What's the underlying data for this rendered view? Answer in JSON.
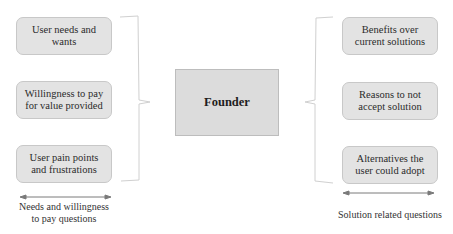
{
  "diagram": {
    "center": {
      "label": "Founder"
    },
    "left_group": {
      "items": [
        {
          "label": "User needs and wants"
        },
        {
          "label": "Willingness to pay for value provided"
        },
        {
          "label": "User pain points and frustrations"
        }
      ],
      "caption": "Needs and willingness to pay questions"
    },
    "right_group": {
      "items": [
        {
          "label": "Benefits over current solutions"
        },
        {
          "label": "Reasons to not accept solution"
        },
        {
          "label": "Alternatives the user could adopt"
        }
      ],
      "caption": "Solution related questions"
    },
    "colors": {
      "box_fill": "#e3e3e3",
      "box_border": "#c8c8c8",
      "center_fill": "#dcdcdc",
      "line": "#cfcfcf",
      "arrow": "#7a7a7a"
    }
  }
}
